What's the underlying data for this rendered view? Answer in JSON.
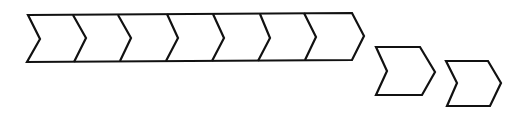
{
  "diagram": {
    "type": "chevron-process",
    "colors": {
      "stroke": "#111111",
      "fill": "#ffffff"
    },
    "main_bar": {
      "segments": 7,
      "outline": "28,15 352,13 364,36 352,60 27,62 40,39",
      "dividers": [
        "73,15 86,38 74,62",
        "118,15 131,38 120,61",
        "167,14 178,38 166,61",
        "213,14 224,38 212,61",
        "260,14 270,38 258,61",
        "304,13 316,37 305,60"
      ]
    },
    "detached_chevrons": [
      {
        "outline": "376,47 420,47 435,72 422,95 376,95 387,71"
      },
      {
        "outline": "446,61 488,61 501,83 490,106 447,106 457,83"
      }
    ]
  }
}
